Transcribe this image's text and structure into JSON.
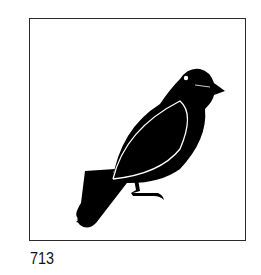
{
  "figure": {
    "symbol": "bird-icon",
    "caption": "713",
    "colors": {
      "ink": "#000000",
      "border": "#2a2a2a",
      "background": "#ffffff"
    }
  }
}
